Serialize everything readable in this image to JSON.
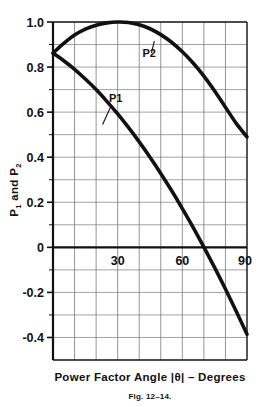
{
  "figure": {
    "caption": "Fig. 12–14.",
    "xlabel_parts": {
      "before": "Power Factor Angle ",
      "theta": "|θ|",
      "after": " – Degrees"
    },
    "ylabel_parts": {
      "p": "P",
      "one": "1",
      "and": " and P",
      "two": "2"
    }
  },
  "chart_data": {
    "type": "line",
    "title": "",
    "xlabel": "Power Factor Angle |θ| – Degrees",
    "ylabel": "P1 and P2",
    "xlim": [
      0,
      90
    ],
    "ylim": [
      -0.5,
      1.0
    ],
    "xticks": [
      30,
      60,
      90
    ],
    "xtick_labels": [
      "30",
      "60",
      "90"
    ],
    "yticks": [
      1.0,
      0.8,
      0.6,
      0.4,
      0.2,
      0,
      -0.2,
      -0.4
    ],
    "ytick_labels": [
      "1.0",
      "0.8",
      "0.6",
      "0.4",
      "0.2",
      "0",
      "-0.2",
      "-0.4"
    ],
    "grid": true,
    "grid_major_x_step": 10,
    "grid_minor_y_step": 0.1,
    "zero_line": true,
    "legend": "inline-annotations",
    "annotations": [
      {
        "text": "P1",
        "label_x": 26,
        "label_y": 0.645,
        "point_x": 23,
        "point_y": 0.545
      },
      {
        "text": "P2",
        "label_x": 41.5,
        "label_y": 0.845,
        "point_x": 47,
        "point_y": 0.915
      }
    ],
    "series": [
      {
        "name": "P1",
        "x": [
          0,
          5,
          10,
          15,
          20,
          25,
          30,
          35,
          40,
          45,
          50,
          55,
          60,
          65,
          70,
          75,
          80,
          85,
          90
        ],
        "y": [
          0.862,
          0.828,
          0.79,
          0.747,
          0.7,
          0.648,
          0.592,
          0.532,
          0.468,
          0.4,
          0.328,
          0.252,
          0.172,
          0.089,
          0.001,
          -0.09,
          -0.185,
          -0.284,
          -0.386
        ]
      },
      {
        "name": "P2",
        "x": [
          0,
          5,
          10,
          15,
          20,
          25,
          30,
          35,
          40,
          45,
          50,
          55,
          60,
          65,
          70,
          75,
          80,
          85,
          90
        ],
        "y": [
          0.862,
          0.905,
          0.942,
          0.968,
          0.986,
          0.996,
          1.0,
          0.998,
          0.988,
          0.97,
          0.944,
          0.91,
          0.868,
          0.818,
          0.76,
          0.694,
          0.622,
          0.55,
          0.49
        ]
      }
    ]
  }
}
